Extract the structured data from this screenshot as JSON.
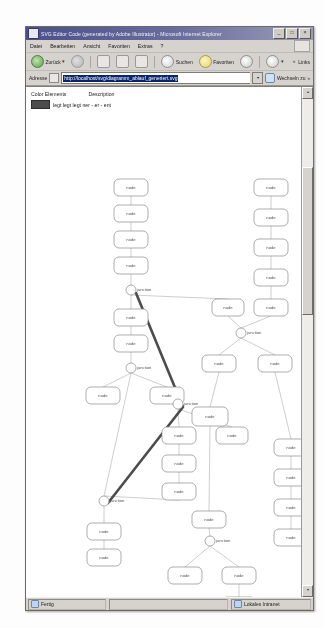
{
  "window": {
    "title": "SVG Editor Code (generated by Adobe Illustrator) - Microsoft Internet Explorer",
    "buttons": {
      "minimize": "_",
      "maximize": "□",
      "close": "×"
    }
  },
  "menubar": {
    "items": [
      {
        "label": "Datei"
      },
      {
        "label": "Bearbeiten"
      },
      {
        "label": "Ansicht"
      },
      {
        "label": "Favoriten"
      },
      {
        "label": "Extras"
      },
      {
        "label": "?"
      }
    ]
  },
  "toolbar": {
    "back_label": "Zurück",
    "back_caret": "▾",
    "search_label": "Suchen",
    "favorites_label": "Favoriten",
    "forward_caret": "▾",
    "links_label": "Links",
    "chevron": "»",
    "icons": {
      "back": "back-arrow-icon",
      "forward": "forward-arrow-icon",
      "stop": "stop-icon",
      "refresh": "refresh-icon",
      "home": "home-icon",
      "search": "search-icon",
      "favorites": "star-icon",
      "media": "media-icon",
      "history": "history-icon"
    }
  },
  "addressbar": {
    "label": "Adresse",
    "url": "http://localhost/svg/diagramm_ablauf_generiert.svg",
    "dropdown_caret": "▾",
    "go_label": "Wechseln zu",
    "links_label": "Links",
    "chevron": "»"
  },
  "legend": {
    "col_color": "Color Elements",
    "col_description": "Description",
    "swatch_color": "#4c4c4c",
    "description": "legt legt legt ner - er - ent"
  },
  "statusbar": {
    "left": "Fertig",
    "middle": "",
    "right": "Lokales Intranet"
  },
  "scrollbar": {
    "up": "▴",
    "down": "▾"
  },
  "diagram": {
    "node_fill": "#ffffff",
    "node_stroke": "#8a8a8a",
    "edge_color": "#b9b9b9",
    "highlight_color": "#4c4c4c",
    "nodes": [
      {
        "id": "n1",
        "shape": "rounded-rect",
        "x": 88,
        "y": 92,
        "w": 34,
        "h": 17,
        "label": "node"
      },
      {
        "id": "n2",
        "shape": "rounded-rect",
        "x": 88,
        "y": 118,
        "w": 34,
        "h": 17,
        "label": "node"
      },
      {
        "id": "n3",
        "shape": "rounded-rect",
        "x": 88,
        "y": 144,
        "w": 34,
        "h": 17,
        "label": "node"
      },
      {
        "id": "n4",
        "shape": "rounded-rect",
        "x": 88,
        "y": 170,
        "w": 34,
        "h": 17,
        "label": "node"
      },
      {
        "id": "j1",
        "shape": "circle",
        "x": 105,
        "y": 203,
        "r": 5,
        "label": "junction"
      },
      {
        "id": "n5",
        "shape": "rounded-rect",
        "x": 88,
        "y": 222,
        "w": 34,
        "h": 17,
        "label": "node"
      },
      {
        "id": "n6",
        "shape": "rounded-rect",
        "x": 88,
        "y": 248,
        "w": 34,
        "h": 17,
        "label": "node"
      },
      {
        "id": "j2",
        "shape": "circle",
        "x": 105,
        "y": 281,
        "r": 5,
        "label": "junction"
      },
      {
        "id": "n7",
        "shape": "rounded-rect",
        "x": 60,
        "y": 300,
        "w": 34,
        "h": 17,
        "label": "node"
      },
      {
        "id": "n8",
        "shape": "rounded-rect",
        "x": 124,
        "y": 300,
        "w": 34,
        "h": 17,
        "label": "node"
      },
      {
        "id": "j3",
        "shape": "circle",
        "x": 152,
        "y": 317,
        "r": 5,
        "label": "junction"
      },
      {
        "id": "n9",
        "shape": "rounded-rect",
        "x": 136,
        "y": 340,
        "w": 34,
        "h": 17,
        "label": "node"
      },
      {
        "id": "n10",
        "shape": "rounded-rect",
        "x": 190,
        "y": 340,
        "w": 32,
        "h": 17,
        "label": "node"
      },
      {
        "id": "n11",
        "shape": "rounded-rect",
        "x": 136,
        "y": 368,
        "w": 34,
        "h": 17,
        "label": "node"
      },
      {
        "id": "n12",
        "shape": "rounded-rect",
        "x": 136,
        "y": 396,
        "w": 34,
        "h": 17,
        "label": "node"
      },
      {
        "id": "j4",
        "shape": "circle",
        "x": 78,
        "y": 414,
        "r": 5,
        "label": "junction"
      },
      {
        "id": "n13",
        "shape": "rounded-rect",
        "x": 61,
        "y": 436,
        "w": 34,
        "h": 17,
        "label": "node"
      },
      {
        "id": "n14",
        "shape": "rounded-rect",
        "x": 61,
        "y": 462,
        "w": 34,
        "h": 17,
        "label": "node"
      },
      {
        "id": "r1",
        "shape": "rounded-rect",
        "x": 228,
        "y": 92,
        "w": 34,
        "h": 17,
        "label": "node"
      },
      {
        "id": "r2",
        "shape": "rounded-rect",
        "x": 228,
        "y": 122,
        "w": 34,
        "h": 17,
        "label": "node"
      },
      {
        "id": "r3",
        "shape": "rounded-rect",
        "x": 228,
        "y": 152,
        "w": 34,
        "h": 17,
        "label": "node"
      },
      {
        "id": "r4",
        "shape": "rounded-rect",
        "x": 228,
        "y": 182,
        "w": 34,
        "h": 17,
        "label": "node"
      },
      {
        "id": "r5",
        "shape": "rounded-rect",
        "x": 228,
        "y": 212,
        "w": 34,
        "h": 17,
        "label": "node"
      },
      {
        "id": "m1",
        "shape": "rounded-rect",
        "x": 186,
        "y": 212,
        "w": 32,
        "h": 17,
        "label": "node"
      },
      {
        "id": "j5",
        "shape": "circle",
        "x": 215,
        "y": 246,
        "r": 5,
        "label": "junction"
      },
      {
        "id": "m2",
        "shape": "rounded-rect",
        "x": 176,
        "y": 268,
        "w": 34,
        "h": 17,
        "label": "node"
      },
      {
        "id": "m3",
        "shape": "rounded-rect",
        "x": 232,
        "y": 268,
        "w": 34,
        "h": 17,
        "label": "node"
      },
      {
        "id": "c1",
        "shape": "rounded-rect",
        "x": 166,
        "y": 320,
        "w": 36,
        "h": 19,
        "label": "node"
      },
      {
        "id": "c2",
        "shape": "rounded-rect",
        "x": 166,
        "y": 424,
        "w": 34,
        "h": 17,
        "label": "node"
      },
      {
        "id": "j6",
        "shape": "circle",
        "x": 184,
        "y": 454,
        "r": 5,
        "label": "junction"
      },
      {
        "id": "c3",
        "shape": "rounded-rect",
        "x": 142,
        "y": 480,
        "w": 34,
        "h": 17,
        "label": "node"
      },
      {
        "id": "c4",
        "shape": "rounded-rect",
        "x": 196,
        "y": 480,
        "w": 34,
        "h": 17,
        "label": "node"
      },
      {
        "id": "c5",
        "shape": "rounded-rect",
        "x": 196,
        "y": 510,
        "w": 34,
        "h": 17,
        "label": "node"
      },
      {
        "id": "c6",
        "shape": "rounded-rect",
        "x": 196,
        "y": 538,
        "w": 34,
        "h": 17,
        "label": "node"
      },
      {
        "id": "f1",
        "shape": "rounded-rect",
        "x": 248,
        "y": 352,
        "w": 34,
        "h": 17,
        "label": "node"
      },
      {
        "id": "f2",
        "shape": "rounded-rect",
        "x": 248,
        "y": 382,
        "w": 34,
        "h": 17,
        "label": "node"
      },
      {
        "id": "f3",
        "shape": "rounded-rect",
        "x": 248,
        "y": 412,
        "w": 34,
        "h": 17,
        "label": "node"
      },
      {
        "id": "f4",
        "shape": "rounded-rect",
        "x": 248,
        "y": 442,
        "w": 34,
        "h": 17,
        "label": "node"
      }
    ],
    "highlight_path": [
      {
        "x": 110,
        "y": 206
      },
      {
        "x": 157,
        "y": 320
      },
      {
        "x": 82,
        "y": 416
      }
    ]
  }
}
